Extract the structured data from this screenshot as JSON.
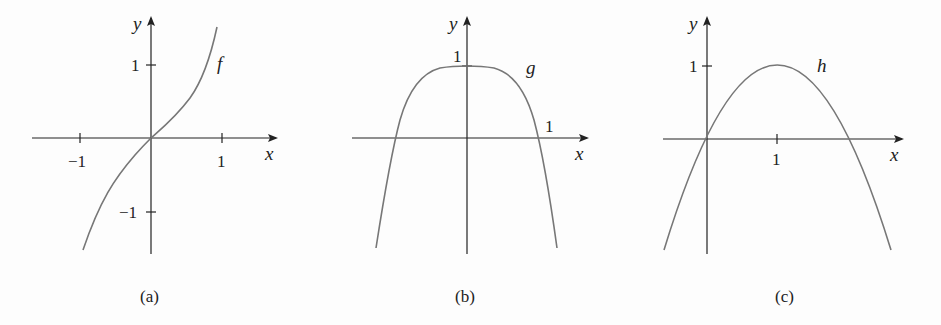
{
  "panels": [
    {
      "caption": "(a)",
      "function_label": "f",
      "x_axis_label": "x",
      "y_axis_label": "y",
      "x_ticks": [
        "−1",
        "1"
      ],
      "y_ticks": [
        "1",
        "−1"
      ]
    },
    {
      "caption": "(b)",
      "function_label": "g",
      "x_axis_label": "x",
      "y_axis_label": "y",
      "x_ticks": [
        "1"
      ],
      "y_ticks": [
        "1"
      ]
    },
    {
      "caption": "(c)",
      "function_label": "h",
      "x_axis_label": "x",
      "y_axis_label": "y",
      "x_ticks": [
        "1"
      ],
      "y_ticks": [
        "1"
      ]
    }
  ],
  "colors": {
    "axis": "#222222",
    "curve": "#777777"
  }
}
